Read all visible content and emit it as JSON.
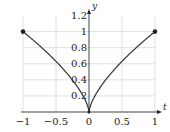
{
  "chart_data": {
    "type": "line",
    "title": "",
    "xlabel": "t",
    "ylabel": "y",
    "xlim": [
      -1,
      1
    ],
    "ylim": [
      0,
      1.2
    ],
    "grid": true,
    "legend": null,
    "x_ticks": [
      "−1",
      "−0.5",
      "0",
      "0.5",
      "1"
    ],
    "y_ticks": [
      "0.2",
      "0.4",
      "0.6",
      "0.8",
      "1",
      "1.2"
    ],
    "series": [
      {
        "name": "y = |t|^(2/3)",
        "x": [
          -1,
          -0.75,
          -0.5,
          -0.25,
          -0.1,
          0,
          0.1,
          0.25,
          0.5,
          0.75,
          1
        ],
        "y": [
          1,
          0.83,
          0.63,
          0.4,
          0.22,
          0,
          0.22,
          0.4,
          0.63,
          0.83,
          1
        ]
      }
    ],
    "markers": [
      {
        "t": -1,
        "y": 1
      },
      {
        "t": 0,
        "y": 0
      },
      {
        "t": 1,
        "y": 1
      }
    ]
  }
}
